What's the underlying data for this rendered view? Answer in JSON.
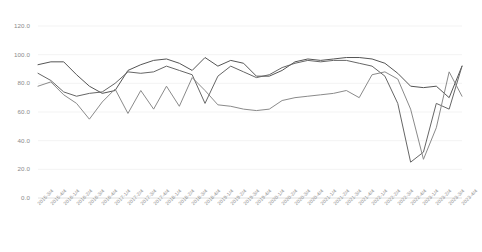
{
  "chart_data": {
    "type": "line",
    "title": "",
    "subtitle": "",
    "xlabel": "",
    "ylabel": "",
    "ylim": [
      0,
      120
    ],
    "ytick_values": [
      0,
      20,
      40,
      60,
      80,
      100,
      120
    ],
    "ytick_labels": [
      "0.0",
      "20.0",
      "40.0",
      "60.0",
      "80.0",
      "100.0",
      "120.0"
    ],
    "grid": true,
    "legend": "none",
    "categories": [
      "2015-3/4",
      "2015-4/4",
      "2016-1/4",
      "2016-2/4",
      "2016-3/4",
      "2016-4/4",
      "2017-1/4",
      "2017-2/4",
      "2017-3/4",
      "2017-4/4",
      "2018-1/4",
      "2018-2/4",
      "2018-3/4",
      "2018-4/4",
      "2019-1/4",
      "2019-2/4",
      "2019-3/4",
      "2019-4/4",
      "2020-1/4",
      "2020-2/4",
      "2020-3/4",
      "2020-4/4",
      "2021-1/4",
      "2021-2/4",
      "2021-3/4",
      "2021-4/4",
      "2022-1/4",
      "2022-2/4",
      "2022-3/4",
      "2022-4/4",
      "2023-1/4",
      "2023-2/4",
      "2023-3/4",
      "2023-4/4"
    ],
    "series": [
      {
        "name": "series-1",
        "color": "#555555",
        "values": [
          93,
          95,
          95,
          86,
          78,
          73,
          75,
          89,
          93,
          96,
          97,
          94,
          89,
          98,
          92,
          96,
          94,
          85,
          85,
          89,
          95,
          97,
          96,
          97,
          98,
          98,
          97,
          94,
          87,
          78,
          77,
          78,
          70,
          92
        ]
      },
      {
        "name": "series-2",
        "color": "#666666",
        "values": [
          87,
          82,
          74,
          71,
          73,
          74,
          80,
          88,
          87,
          88,
          92,
          89,
          86,
          66,
          85,
          92,
          88,
          84,
          86,
          91,
          94,
          96,
          95,
          96,
          96,
          94,
          92,
          85,
          66,
          25,
          32,
          66,
          62,
          92
        ]
      },
      {
        "name": "series-3",
        "color": "#8a8a8a",
        "values": [
          78,
          81,
          72,
          66,
          55,
          67,
          76,
          59,
          75,
          62,
          78,
          64,
          84,
          75,
          65,
          64,
          62,
          61,
          62,
          68,
          70,
          71,
          72,
          73,
          75,
          70,
          86,
          88,
          83,
          62,
          27,
          49,
          88,
          71
        ]
      }
    ]
  }
}
